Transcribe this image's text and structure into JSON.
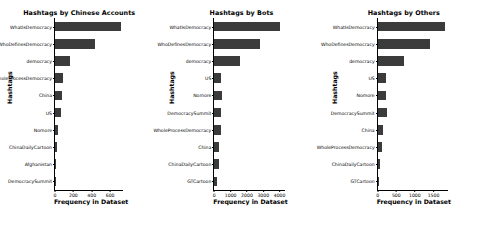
{
  "figure": {
    "background": "#ffffff",
    "bar_color": "#3b3b3b",
    "axis_color": "#000000"
  },
  "chart_data": [
    {
      "type": "bar",
      "orientation": "horizontal",
      "title": "Hashtags by Chinese Accounts",
      "xlabel": "Frequency in Dataset",
      "ylabel": "Hashtags",
      "xlim": [
        0,
        740
      ],
      "xticks": [
        0,
        200,
        400,
        600
      ],
      "xticklabels": [
        "0",
        "200",
        "400",
        "600"
      ],
      "grid": false,
      "legend": null,
      "categories": [
        "WhatIsDemocracy",
        "WhoDefinesDemocracy",
        "democracy",
        "WholeProcessDemocracy",
        "China",
        "US",
        "Nomore",
        "ChinaDailyCartoon",
        "Afghanistan",
        "DemocracySummit"
      ],
      "values": [
        715,
        430,
        165,
        92,
        72,
        63,
        28,
        22,
        12,
        11
      ]
    },
    {
      "type": "bar",
      "orientation": "horizontal",
      "title": "Hashtags by Bots",
      "xlabel": "Frequency in Dataset",
      "ylabel": "Hashtags",
      "xlim": [
        0,
        4350
      ],
      "xticks": [
        0,
        1000,
        2000,
        3000,
        4000
      ],
      "xticklabels": [
        "0",
        "1000",
        "2000",
        "3000",
        "4000"
      ],
      "grid": false,
      "legend": null,
      "categories": [
        "WhatIsDemocracy",
        "WhoDefinesDemocracy",
        "democracy",
        "US",
        "Nomore",
        "DemocracySummit",
        "WholeProcessDemocracy",
        "China",
        "ChinaDailyCartoon",
        "GTCartoon"
      ],
      "values": [
        4050,
        2800,
        1550,
        430,
        460,
        430,
        400,
        310,
        290,
        140
      ]
    },
    {
      "type": "bar",
      "orientation": "horizontal",
      "title": "Hashtags by Others",
      "xlabel": "Frequency in Dataset",
      "ylabel": "Hashtags",
      "xlim": [
        0,
        1880
      ],
      "xticks": [
        0,
        500,
        1000,
        1500
      ],
      "xticklabels": [
        "0",
        "500",
        "1000",
        "1500"
      ],
      "grid": false,
      "legend": null,
      "categories": [
        "WhatIsDemocracy",
        "WhoDefinesDemocracy",
        "democracy",
        "US",
        "Nomore",
        "DemocracySummit",
        "China",
        "WholeProcessDemocracy",
        "ChinaDailyCartoon",
        "GTCartoon"
      ],
      "values": [
        1800,
        1400,
        720,
        220,
        230,
        240,
        150,
        115,
        55,
        45
      ]
    }
  ]
}
